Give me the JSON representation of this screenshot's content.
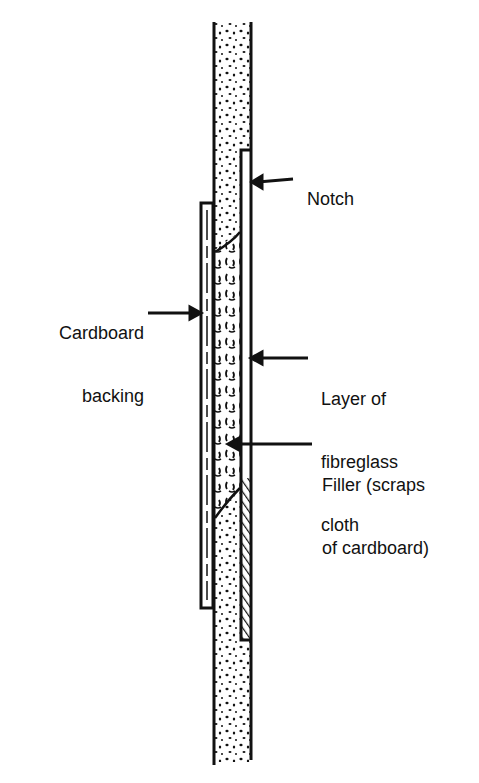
{
  "figure": {
    "type": "cross-section",
    "colors": {
      "ink": "#111111",
      "paper": "#ffffff"
    }
  },
  "labels": {
    "notch": "Notch",
    "cardboard_backing": [
      "Cardboard",
      "backing"
    ],
    "fibreglass": [
      "Layer of",
      "fibreglass",
      "cloth"
    ],
    "filler": [
      "Filler (scraps",
      "of cardboard)"
    ]
  }
}
